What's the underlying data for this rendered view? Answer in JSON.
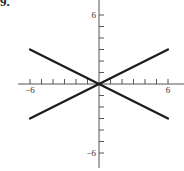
{
  "problem": {
    "number": "9."
  },
  "chart_data": {
    "type": "line",
    "title": "",
    "xlabel": "",
    "ylabel": "",
    "xlim": [
      -6,
      6
    ],
    "ylim": [
      -6,
      6
    ],
    "grid": false,
    "legend": null,
    "x_tick_labels": [
      {
        "value": -6,
        "label": "−6"
      },
      {
        "value": 6,
        "label": "6"
      }
    ],
    "y_tick_labels": [
      {
        "value": 6,
        "label": "6"
      },
      {
        "value": -6,
        "label": "−6"
      }
    ],
    "x_ticks": [
      -6,
      -5,
      -4,
      -3,
      -2,
      -1,
      1,
      2,
      3,
      4,
      5,
      6
    ],
    "y_ticks": [
      -6,
      -5,
      -4,
      -3,
      -2,
      -1,
      1,
      2,
      3,
      4,
      5,
      6
    ],
    "series": [
      {
        "name": "y = x/2",
        "x": [
          -6,
          6
        ],
        "y": [
          -3,
          3
        ]
      },
      {
        "name": "y = -x/2",
        "x": [
          -6,
          6
        ],
        "y": [
          3,
          -3
        ]
      }
    ]
  }
}
